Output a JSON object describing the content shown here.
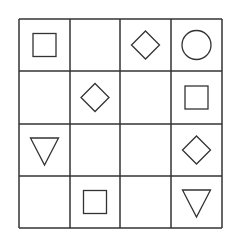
{
  "puzzle": {
    "rows": 4,
    "cols": 4,
    "line_color": "#333333",
    "shape_color": "#333333",
    "background": "#ffffff",
    "col_lines": [
      19,
      70,
      120,
      171,
      222
    ],
    "row_lines": [
      19,
      71,
      124,
      176,
      228
    ],
    "cells": [
      [
        "square",
        "",
        "diamond",
        "circle"
      ],
      [
        "",
        "diamond",
        "",
        "square"
      ],
      [
        "triangle-down",
        "",
        "",
        "diamond"
      ],
      [
        "",
        "square",
        "",
        "triangle-down"
      ]
    ]
  }
}
